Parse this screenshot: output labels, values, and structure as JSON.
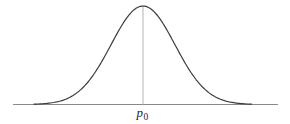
{
  "figure": {
    "label": {
      "base": "p",
      "subscript": "0"
    }
  },
  "colors": {
    "background": "#ffffff",
    "curve": "#3c3c3c",
    "axis": "#8a8a8a",
    "center_line": "#b3b3b3",
    "label": "#1f1f1f"
  },
  "chart_data": {
    "type": "line",
    "title": "",
    "xlabel": "",
    "ylabel": "",
    "grid": false,
    "legend": false,
    "series": [
      {
        "name": "normal-curve",
        "shape": "gaussian",
        "center_label": "p0"
      }
    ],
    "x_ticks": [
      {
        "position": "center",
        "label": "p0"
      }
    ],
    "annotations": [
      {
        "type": "vertical-reference-line",
        "at": "p0",
        "extent": "axis-to-peak"
      }
    ],
    "layout": {
      "width": 290,
      "height": 124,
      "axis_y": 104.5,
      "axis_x_start": 13,
      "axis_x_end": 278,
      "peak_x": 143,
      "peak_y": 6,
      "sigma_px": 32,
      "curve_x_start": 34,
      "curve_x_end": 252,
      "center_line_x": 143
    }
  }
}
